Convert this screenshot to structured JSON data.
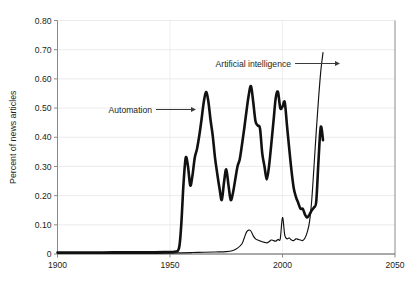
{
  "chart_data": {
    "type": "line",
    "title": "",
    "subtitle": "",
    "xlabel": "",
    "ylabel": "Percent of news articles",
    "xlim": [
      1900,
      2050
    ],
    "ylim": [
      0,
      0.8
    ],
    "grid": true,
    "legend_position": "inline-annotations",
    "x_ticks": [
      "1900",
      "1950",
      "2000",
      "2050"
    ],
    "x_tick_values": [
      1900,
      1950,
      2000,
      2050
    ],
    "y_ticks": [
      "0",
      "0.10",
      "0.20",
      "0.30",
      "0.40",
      "0.50",
      "0.60",
      "0.70",
      "0.80"
    ],
    "y_tick_values": [
      0,
      0.1,
      0.2,
      0.3,
      0.4,
      0.5,
      0.6,
      0.7,
      0.8
    ],
    "annotations": [
      {
        "text": "Automation",
        "points_to_series": "Automation",
        "x": 1958,
        "y": 0.48
      },
      {
        "text": "Artificial intelligence",
        "points_to_series": "Artificial intelligence",
        "x": 2012,
        "y": 0.66
      }
    ],
    "series": [
      {
        "name": "Automation",
        "x": [
          1900,
          1910,
          1920,
          1930,
          1940,
          1948,
          1952,
          1954,
          1955,
          1956,
          1957,
          1958,
          1959,
          1960,
          1961,
          1962,
          1963,
          1964,
          1965,
          1966,
          1967,
          1968,
          1969,
          1970,
          1971,
          1972,
          1973,
          1974,
          1975,
          1976,
          1977,
          1978,
          1979,
          1980,
          1981,
          1982,
          1983,
          1984,
          1985,
          1986,
          1987,
          1988,
          1989,
          1990,
          1991,
          1992,
          1993,
          1994,
          1995,
          1996,
          1997,
          1998,
          1999,
          2000,
          2001,
          2002,
          2003,
          2004,
          2005,
          2006,
          2007,
          2008,
          2009,
          2010,
          2011,
          2012,
          2013,
          2014,
          2015,
          2016,
          2017,
          2018
        ],
        "y": [
          0.005,
          0.005,
          0.005,
          0.006,
          0.006,
          0.007,
          0.008,
          0.02,
          0.1,
          0.24,
          0.33,
          0.3,
          0.235,
          0.27,
          0.33,
          0.36,
          0.405,
          0.46,
          0.52,
          0.555,
          0.525,
          0.46,
          0.405,
          0.33,
          0.275,
          0.225,
          0.185,
          0.245,
          0.29,
          0.235,
          0.185,
          0.21,
          0.255,
          0.3,
          0.325,
          0.375,
          0.43,
          0.49,
          0.545,
          0.575,
          0.52,
          0.455,
          0.44,
          0.43,
          0.345,
          0.3,
          0.255,
          0.3,
          0.375,
          0.455,
          0.535,
          0.555,
          0.5,
          0.505,
          0.52,
          0.44,
          0.36,
          0.285,
          0.225,
          0.195,
          0.175,
          0.155,
          0.155,
          0.135,
          0.125,
          0.135,
          0.15,
          0.16,
          0.18,
          0.32,
          0.435,
          0.39
        ]
      },
      {
        "name": "Artificial intelligence",
        "x": [
          1900,
          1920,
          1940,
          1950,
          1955,
          1960,
          1965,
          1970,
          1975,
          1978,
          1980,
          1982,
          1983,
          1984,
          1985,
          1986,
          1987,
          1988,
          1989,
          1990,
          1991,
          1992,
          1993,
          1994,
          1995,
          1996,
          1997,
          1998,
          1999,
          2000,
          2001,
          2002,
          2003,
          2004,
          2005,
          2006,
          2007,
          2008,
          2009,
          2010,
          2011,
          2012,
          2013,
          2014,
          2015,
          2016,
          2017,
          2018
        ],
        "y": [
          0.002,
          0.002,
          0.002,
          0.003,
          0.004,
          0.005,
          0.006,
          0.007,
          0.008,
          0.012,
          0.02,
          0.035,
          0.055,
          0.075,
          0.082,
          0.078,
          0.062,
          0.052,
          0.048,
          0.045,
          0.042,
          0.04,
          0.038,
          0.042,
          0.048,
          0.046,
          0.044,
          0.05,
          0.052,
          0.125,
          0.065,
          0.052,
          0.055,
          0.048,
          0.046,
          0.052,
          0.05,
          0.048,
          0.046,
          0.055,
          0.075,
          0.11,
          0.185,
          0.3,
          0.42,
          0.53,
          0.625,
          0.69
        ]
      }
    ]
  },
  "caption": {
    "text": ""
  }
}
